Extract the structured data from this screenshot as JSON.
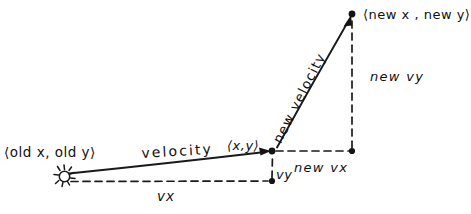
{
  "diagram": {
    "style": "hand-drawn sketch, black ink on white",
    "background_color": "#ffffff",
    "ink_color": "#1a1a1a",
    "labels": {
      "old_position": "⟨old x, old y⟩",
      "new_position": "⟨new x , new y⟩",
      "midpoint": "⟨x,y⟩",
      "velocity": "velocity",
      "new_velocity": "new velocity",
      "new_vy": "new vy",
      "new_vx": "new vx",
      "vy": "vy",
      "vx": "vx"
    },
    "nodes": [
      {
        "name": "old-position-marker",
        "x": 66,
        "y": 177,
        "marker": "spark-glyph"
      },
      {
        "name": "midpoint-node",
        "x": 272,
        "y": 151,
        "marker": "dot"
      },
      {
        "name": "new-position-node",
        "x": 352,
        "y": 14,
        "marker": "dot"
      },
      {
        "name": "vy-foot-node",
        "x": 272,
        "y": 181,
        "marker": "dot"
      },
      {
        "name": "new-vx-end-node",
        "x": 352,
        "y": 151,
        "marker": "dot"
      }
    ],
    "vectors": [
      {
        "name": "velocity-vector",
        "from": [
          68,
          173
        ],
        "to": [
          270,
          151
        ],
        "style": "solid-arrow"
      },
      {
        "name": "new-velocity-vector",
        "from": [
          276,
          148
        ],
        "to": [
          350,
          18
        ],
        "style": "solid-arrow"
      }
    ],
    "guides": [
      {
        "name": "vx-baseline",
        "from": [
          70,
          181
        ],
        "to": [
          270,
          181
        ],
        "style": "dashed"
      },
      {
        "name": "vy-riser",
        "from": [
          272,
          179
        ],
        "to": [
          272,
          153
        ],
        "style": "dashed"
      },
      {
        "name": "new-vx-guide",
        "from": [
          274,
          151
        ],
        "to": [
          350,
          151
        ],
        "style": "dashed"
      },
      {
        "name": "new-vy-guide",
        "from": [
          352,
          149
        ],
        "to": [
          352,
          18
        ],
        "style": "dashed"
      }
    ]
  }
}
